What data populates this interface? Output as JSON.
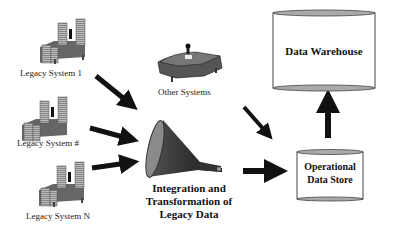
{
  "diagram": {
    "nodes": {
      "legacy_system_1": {
        "label": "Legacy System 1",
        "icon": "server-rack-icon"
      },
      "legacy_system_hash": {
        "label": "Legacy System #",
        "icon": "server-rack-icon"
      },
      "legacy_system_n": {
        "label": "Legacy System N",
        "icon": "server-rack-icon"
      },
      "other_systems": {
        "label": "Other Systems",
        "icon": "desk-workstation-icon"
      },
      "integration": {
        "label_line1": "Integration and",
        "label_line2": "Transformation of",
        "label_line3": "Legacy Data",
        "icon": "funnel-icon"
      },
      "operational_data_store": {
        "label_line1": "Operational",
        "label_line2": "Data Store",
        "icon": "cylinder-database-icon"
      },
      "data_warehouse": {
        "label": "Data Warehouse",
        "icon": "cylinder-database-icon"
      }
    },
    "edges": [
      {
        "from": "Legacy System 1",
        "to": "Integration and Transformation of Legacy Data"
      },
      {
        "from": "Legacy System #",
        "to": "Integration and Transformation of Legacy Data"
      },
      {
        "from": "Legacy System N",
        "to": "Integration and Transformation of Legacy Data"
      },
      {
        "from": "Other Systems",
        "to": "Operational Data Store"
      },
      {
        "from": "Integration and Transformation of Legacy Data",
        "to": "Operational Data Store"
      },
      {
        "from": "Operational Data Store",
        "to": "Data Warehouse"
      }
    ]
  }
}
